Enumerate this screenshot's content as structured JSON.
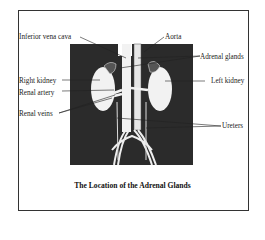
{
  "figure": {
    "caption": "The Location of the Adrenal Glands",
    "colors": {
      "body": "#2b2b2b",
      "organ": "#f2f2f2",
      "line": "#222222",
      "border": "#333333"
    },
    "labels": {
      "inferior_vena_cava": "Inferior vena cava",
      "aorta": "Aorta",
      "adrenal_glands": "Adrenal glands",
      "right_kidney": "Right kidney",
      "left_kidney": "Left kidney",
      "renal_artery": "Renal artery",
      "renal_veins": "Renal veins",
      "ureters": "Ureters"
    }
  }
}
